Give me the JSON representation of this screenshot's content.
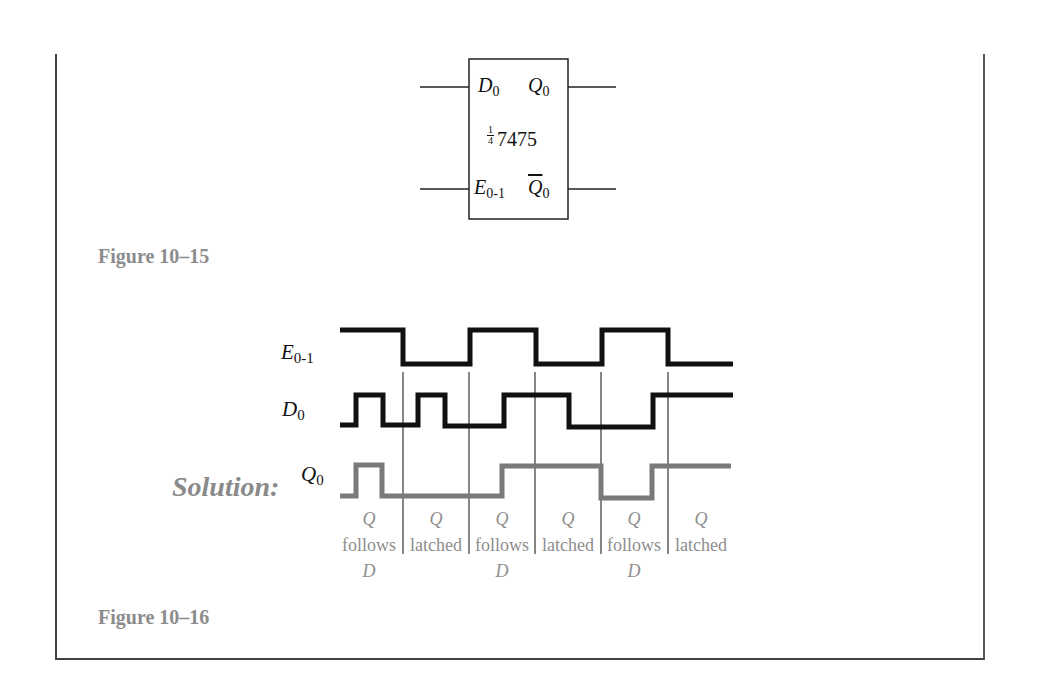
{
  "figure_15": {
    "caption": "Figure 10–15",
    "chip": {
      "part_fraction_num": "1",
      "part_fraction_den": "4",
      "part_number": "7475",
      "pins": {
        "d_input": {
          "base": "D",
          "sub": "0"
        },
        "q_output": {
          "base": "Q",
          "sub": "0"
        },
        "enable_input": {
          "base": "E",
          "sub": "0-1"
        },
        "q_bar_output": {
          "base": "Q",
          "sub": "0",
          "overbar": true
        }
      }
    }
  },
  "figure_16": {
    "caption": "Figure 10–16",
    "solution_label": "Solution:",
    "signals": [
      {
        "name": "E",
        "sub": "0-1",
        "color": "#111111",
        "levels": [
          1,
          0,
          1,
          0,
          1,
          0
        ]
      },
      {
        "name": "D",
        "sub": "0",
        "color": "#111111"
      },
      {
        "name": "Q",
        "sub": "0",
        "color": "#7a7a7a"
      }
    ],
    "annotations": [
      {
        "q": "Q",
        "word": "follows",
        "d": "D"
      },
      {
        "q": "Q",
        "word": "latched",
        "d": ""
      },
      {
        "q": "Q",
        "word": "follows",
        "d": "D"
      },
      {
        "q": "Q",
        "word": "latched",
        "d": ""
      },
      {
        "q": "Q",
        "word": "follows",
        "d": "D"
      },
      {
        "q": "Q",
        "word": "latched",
        "d": ""
      }
    ]
  },
  "colors": {
    "caption": "#8c8c8c",
    "waveform": "#111111",
    "q_waveform": "#7a7a7a",
    "annotation": "#8e8e8e"
  }
}
